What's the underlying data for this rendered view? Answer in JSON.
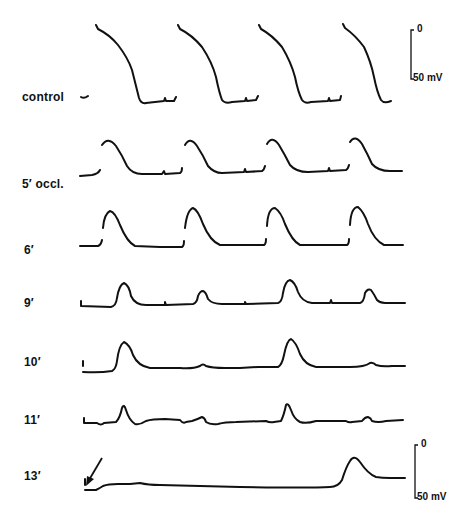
{
  "figure": {
    "rows": [
      {
        "label": "control",
        "label_y": 97
      },
      {
        "label": "5′ occl.",
        "label_y": 184
      },
      {
        "label": "6′",
        "label_y": 250
      },
      {
        "label": "9′",
        "label_y": 303
      },
      {
        "label": "10′",
        "label_y": 362
      },
      {
        "label": "11′",
        "label_y": 420
      },
      {
        "label": "13′",
        "label_y": 476
      }
    ],
    "scale_bar_top": {
      "top_label": "0",
      "bottom_label": "50 mV"
    },
    "scale_bar_bottom": {
      "top_label": "0",
      "bottom_label": "50 mV"
    },
    "annotation": "arrow-icon"
  }
}
